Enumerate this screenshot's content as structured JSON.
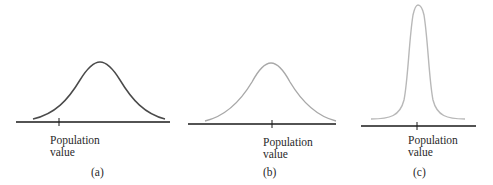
{
  "figure": {
    "panels": [
      {
        "id": "a",
        "caption": "(a)",
        "label_line1": "Population",
        "label_line2": "value",
        "curve_color": "#4a4a4a",
        "description": "Wide normal curve whose center is offset to the right of the population value (biased, high variability)"
      },
      {
        "id": "b",
        "caption": "(b)",
        "label_line1": "Population",
        "label_line2": "value",
        "curve_color": "#a8a8a8",
        "description": "Wide normal curve centered on the population value (unbiased, high variability)"
      },
      {
        "id": "c",
        "caption": "(c)",
        "label_line1": "Population",
        "label_line2": "value",
        "curve_color": "#b8b8b8",
        "description": "Narrow tall normal curve centered on the population value (unbiased, low variability)"
      }
    ],
    "axis_color": "#1a1a1a"
  }
}
